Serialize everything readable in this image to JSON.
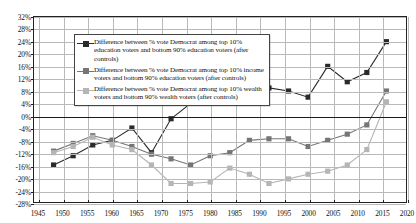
{
  "chart_data": {
    "type": "line",
    "title": "",
    "xlabel": "",
    "ylabel": "",
    "xlim": [
      1944,
      2020
    ],
    "ylim": [
      -28,
      32
    ],
    "ytick_step": 4,
    "xtick_step": 5,
    "grid": true,
    "legend_position": "top-left",
    "ytick_labels": [
      "32%",
      "28%",
      "24%",
      "20%",
      "16%",
      "12%",
      "8%",
      "4%",
      "0%",
      "-4%",
      "-8%",
      "-12%",
      "-16%",
      "-20%",
      "-24%",
      "-28%"
    ],
    "ytick_values": [
      32,
      28,
      24,
      20,
      16,
      12,
      8,
      4,
      0,
      -4,
      -8,
      -12,
      -16,
      -20,
      -24,
      -28
    ],
    "xtick_labels": [
      "1945",
      "1950",
      "1955",
      "1960",
      "1965",
      "1970",
      "1975",
      "1980",
      "1985",
      "1990",
      "1995",
      "2000",
      "2005",
      "2010",
      "2015",
      "2020"
    ],
    "xtick_values": [
      1945,
      1950,
      1955,
      1960,
      1965,
      1970,
      1975,
      1980,
      1985,
      1990,
      1995,
      2000,
      2005,
      2010,
      2015,
      2020
    ],
    "series": [
      {
        "name": "Difference between % vote Democrat among top 10% education voters and bottom 90% education voters (after controls)",
        "color": "#2b2b2b",
        "x": [
          1948,
          1952,
          1956,
          1960,
          1964,
          1968,
          1972,
          1976,
          1980,
          1984,
          1988,
          1992,
          1996,
          2000,
          2004,
          2008,
          2012,
          2016
        ],
        "values": [
          -16,
          -13,
          -9.5,
          -8,
          -4,
          -12,
          -1,
          4,
          8,
          8.5,
          8,
          9,
          8,
          6,
          16,
          11,
          14,
          24
        ]
      },
      {
        "name": "Difference between % vote Democrat among top 10% income voters and bottom 90% education voters (after controls)",
        "color": "#757575",
        "x": [
          1948,
          1952,
          1956,
          1960,
          1964,
          1968,
          1972,
          1976,
          1980,
          1984,
          1988,
          1992,
          1996,
          2000,
          2004,
          2008,
          2012,
          2016
        ],
        "values": [
          -11.5,
          -9,
          -6.5,
          -8,
          -10,
          -12.5,
          -14,
          -16,
          -13,
          -12,
          -8,
          -7.5,
          -7.5,
          -10,
          -8,
          -6,
          -3,
          8
        ]
      },
      {
        "name": "Difference between % vote Democrat among top 10% wealth voters and bottom 90% wealth voters (after controls)",
        "color": "#b5b5b5",
        "x": [
          1948,
          1952,
          1956,
          1960,
          1964,
          1968,
          1972,
          1976,
          1980,
          1984,
          1988,
          1992,
          1996,
          2000,
          2004,
          2008,
          2012,
          2016
        ],
        "values": [
          -12,
          -10,
          -7,
          -9.5,
          -11,
          -16,
          -22,
          -22,
          -21.5,
          -17,
          -19,
          -22,
          -20.5,
          -19,
          -18,
          -16,
          -11,
          4.5
        ]
      }
    ]
  },
  "legend": {
    "items": [
      {
        "label": "Difference between % vote Democrat among top 10% education voters and bottom 90% education voters (after controls)",
        "marker": "square-marker-dark"
      },
      {
        "label": "Difference between % vote Democrat among top 10% income voters and bottom 90% education voters (after controls)",
        "marker": "square-marker-mid"
      },
      {
        "label": "Difference between % vote Democrat among top 10% wealth voters and bottom 90% wealth voters (after controls)",
        "marker": "square-marker-light"
      }
    ]
  }
}
